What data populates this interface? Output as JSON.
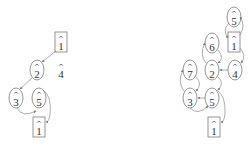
{
  "diagram": {
    "left_graph": {
      "nodes": [
        {
          "id": "L1top",
          "label": "1",
          "hat": "^",
          "shape": "box",
          "cx": 61,
          "cy": 42
        },
        {
          "id": "L2",
          "label": "2",
          "hat": "^",
          "shape": "ellipse",
          "cx": 37,
          "cy": 70
        },
        {
          "id": "L4",
          "label": "4",
          "hat": "^",
          "shape": "plain",
          "cx": 61,
          "cy": 70
        },
        {
          "id": "L3",
          "label": "3",
          "hat": "^",
          "shape": "ellipse",
          "cx": 16,
          "cy": 98
        },
        {
          "id": "L5",
          "label": "5",
          "hat": "^",
          "shape": "ellipse",
          "cx": 39,
          "cy": 98
        },
        {
          "id": "L1bot",
          "label": "1",
          "hat": "^",
          "shape": "box",
          "cx": 39,
          "cy": 127
        }
      ],
      "edges": [
        {
          "from": "L1top",
          "to": "L2"
        },
        {
          "from": "L2",
          "to": "L3"
        },
        {
          "from": "L3",
          "to": "L5"
        },
        {
          "from": "L5",
          "to": "L1bot"
        }
      ]
    },
    "right_graph": {
      "nodes": [
        {
          "id": "R5top",
          "label": "5",
          "hat": "^",
          "shape": "ellipse",
          "cx": 234,
          "cy": 17
        },
        {
          "id": "R1top",
          "label": "1",
          "hat": "^",
          "shape": "box",
          "cx": 234,
          "cy": 42
        },
        {
          "id": "R6",
          "label": "6",
          "hat": "^",
          "shape": "ellipse",
          "cx": 212,
          "cy": 43
        },
        {
          "id": "R2",
          "label": "2",
          "hat": "^",
          "shape": "ellipse",
          "cx": 212,
          "cy": 70
        },
        {
          "id": "R4",
          "label": "4",
          "hat": "^",
          "shape": "ellipse",
          "cx": 235,
          "cy": 70
        },
        {
          "id": "R7",
          "label": "7",
          "hat": "^",
          "shape": "ellipse",
          "cx": 190,
          "cy": 70
        },
        {
          "id": "R3",
          "label": "3",
          "hat": "^",
          "shape": "ellipse",
          "cx": 190,
          "cy": 98
        },
        {
          "id": "R5bot",
          "label": "5",
          "hat": "^",
          "shape": "ellipse",
          "cx": 212,
          "cy": 98
        },
        {
          "id": "R1bot",
          "label": "1",
          "hat": "^",
          "shape": "box",
          "cx": 214,
          "cy": 127
        }
      ],
      "edges": [
        {
          "from": "R5top",
          "to": "R1top"
        },
        {
          "from": "R1top",
          "to": "R5top"
        },
        {
          "from": "R1top",
          "to": "R4"
        },
        {
          "from": "R4",
          "to": "R2"
        },
        {
          "from": "R2",
          "to": "R6"
        },
        {
          "from": "R6",
          "to": "R2"
        },
        {
          "from": "R2",
          "to": "R5bot"
        },
        {
          "from": "R5bot",
          "to": "R3"
        },
        {
          "from": "R3",
          "to": "R7"
        },
        {
          "from": "R7",
          "to": "R3"
        },
        {
          "from": "R3",
          "to": "R5bot"
        },
        {
          "from": "R5bot",
          "to": "R1bot"
        }
      ]
    },
    "colors": {
      "stroke": "#7a7a7a",
      "edge": "#8a8a8a",
      "text": "#333333",
      "background": "#ffffff"
    }
  }
}
